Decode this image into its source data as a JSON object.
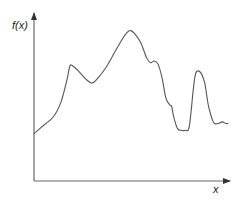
{
  "chart_data": {
    "type": "line",
    "title": "",
    "xlabel": "x",
    "ylabel": "f(x)",
    "grid": false,
    "legend": null,
    "ticks": {
      "x": [],
      "y": []
    },
    "note": "Schematic curve of a function f(x) with no tick marks; values are normalized to 0-100 on both axes (x: left to right, y: bottom to top).",
    "xlim": [
      0,
      100
    ],
    "ylim": [
      0,
      100
    ],
    "series": [
      {
        "name": "f(x)",
        "x": [
          0,
          5,
          10,
          14,
          17,
          18.5,
          20,
          23,
          27,
          30,
          33,
          37,
          41,
          45,
          48,
          50,
          52,
          55,
          58,
          60,
          62,
          64,
          66,
          68,
          70,
          71,
          72,
          74,
          76,
          78,
          80,
          82,
          83,
          84,
          86,
          88,
          89,
          90,
          92,
          93,
          95,
          97,
          99,
          100
        ],
        "y": [
          28,
          33,
          38,
          47,
          60,
          68,
          68,
          65,
          60,
          58,
          61,
          67,
          75,
          83,
          88,
          89,
          87,
          82,
          73,
          70,
          71,
          69,
          61,
          49,
          45,
          44,
          38,
          31,
          30,
          30,
          32,
          53,
          62,
          65,
          64,
          58,
          51,
          44,
          36,
          34,
          34,
          35,
          34,
          34
        ]
      }
    ],
    "features": {
      "start": {
        "x": 0,
        "y": 28
      },
      "local_max_1": {
        "x": 20,
        "y": 68
      },
      "local_min_1": {
        "x": 32,
        "y": 58
      },
      "global_max": {
        "x": 52,
        "y": 89
      },
      "shoulder": {
        "x": 62,
        "y": 71
      },
      "global_min": {
        "x": 82,
        "y": 30
      },
      "local_max_2": {
        "x": 88,
        "y": 65
      },
      "end": {
        "x": 100,
        "y": 34
      }
    }
  },
  "axes": {
    "y_label": "f(x)",
    "x_label": "x"
  },
  "colors": {
    "axis": "#555555",
    "curve": "#555555",
    "label": "#1a1a1a"
  }
}
